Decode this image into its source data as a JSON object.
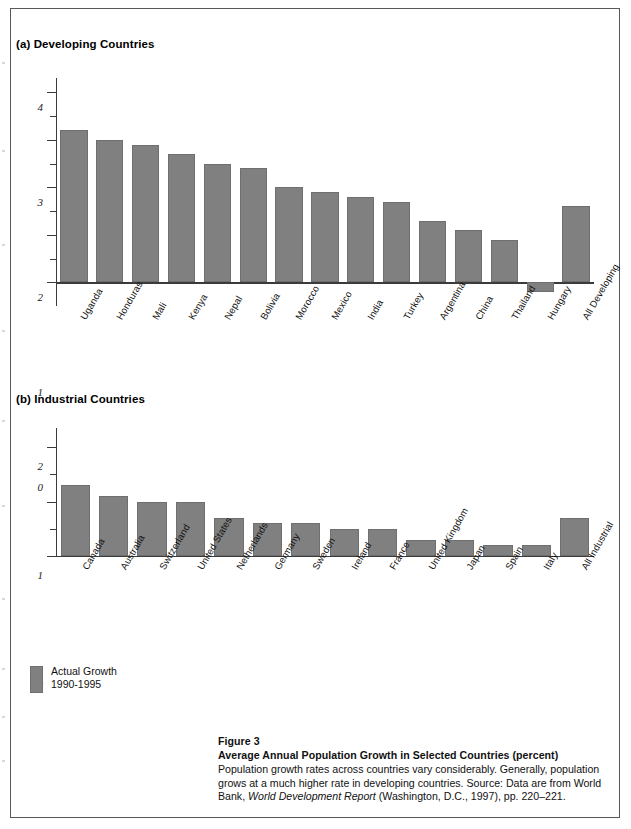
{
  "figure": {
    "number": "Figure 3",
    "title": "Average Annual Population Growth in Selected Countries (percent)",
    "body_part1": "Population growth rates across countries vary considerably. Generally, population grows at a much higher rate in developing countries. Source: Data are from World Bank, ",
    "body_italic": "World Development Report",
    "body_part2": " (Washington, D.C., 1997), pp. 220–221."
  },
  "legend": {
    "label": "Actual Growth",
    "period": "1990-1995",
    "color": "#808080"
  },
  "panels": {
    "a": {
      "title": "(a) Developing Countries"
    },
    "b": {
      "title": "(b) Industrial Countries"
    }
  },
  "chart_data": [
    {
      "type": "bar",
      "title": "(a) Developing Countries",
      "xlabel": "",
      "ylabel": "",
      "ylim": [
        -0.5,
        4.3
      ],
      "yticks_major": [
        0,
        1,
        2,
        3,
        4
      ],
      "yticks_minor": [
        0.5,
        1.5,
        2.5,
        3.5
      ],
      "grid": false,
      "series_name": "Actual Growth 1990-1995",
      "categories": [
        "Uganda",
        "Honduras",
        "Mali",
        "Kenya",
        "Nepal",
        "Bolivia",
        "Morocco",
        "Mexico",
        "India",
        "Turkey",
        "Argentina",
        "China",
        "Thailand",
        "Hungary",
        "All Developing"
      ],
      "values": [
        3.2,
        3.0,
        2.9,
        2.7,
        2.5,
        2.4,
        2.0,
        1.9,
        1.8,
        1.7,
        1.3,
        1.1,
        0.9,
        -0.2,
        1.6
      ]
    },
    {
      "type": "bar",
      "title": "(b) Industrial Countries",
      "xlabel": "",
      "ylabel": "",
      "ylim": [
        0,
        2.35
      ],
      "yticks_major": [
        0,
        1,
        2
      ],
      "yticks_minor": [
        0.5,
        1.5
      ],
      "grid": false,
      "series_name": "Actual Growth 1990-1995",
      "categories": [
        "Canada",
        "Australia",
        "Switzerland",
        "United States",
        "Netherlands",
        "Germany",
        "Sweden",
        "Ireland",
        "France",
        "United Kingdom",
        "Japan",
        "Spain",
        "Italy",
        "All Industrial"
      ],
      "values": [
        1.3,
        1.1,
        1.0,
        1.0,
        0.7,
        0.6,
        0.6,
        0.5,
        0.5,
        0.3,
        0.3,
        0.2,
        0.2,
        0.7
      ]
    }
  ]
}
